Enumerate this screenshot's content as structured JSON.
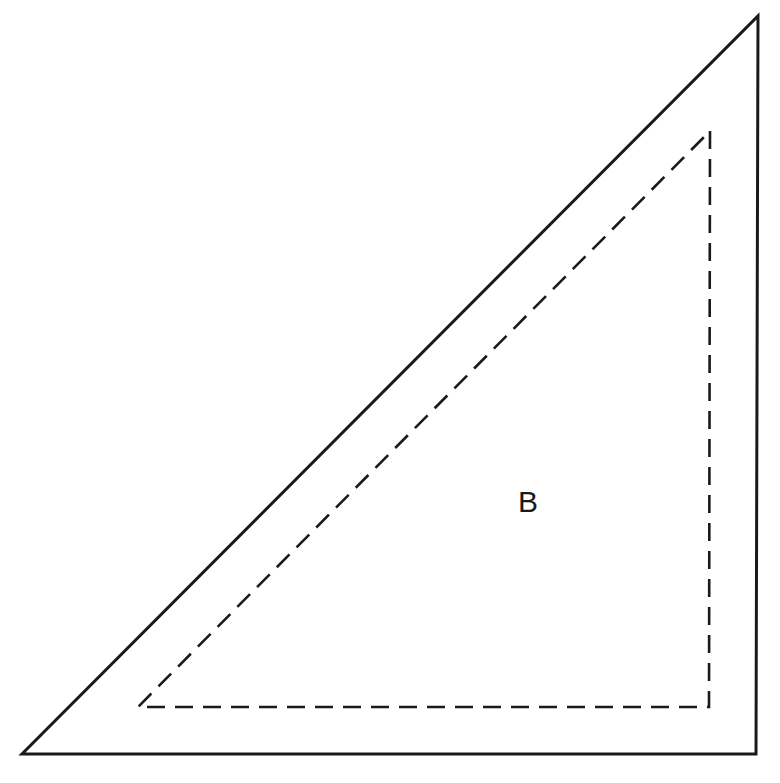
{
  "diagram": {
    "label": "B",
    "outer_triangle": {
      "style": "solid",
      "stroke": "#1a1a1a",
      "points": [
        [
          758,
          16
        ],
        [
          756,
          754
        ],
        [
          22,
          754
        ]
      ]
    },
    "inner_triangle": {
      "style": "dashed",
      "stroke": "#1a1a1a",
      "points": [
        [
          710,
          131
        ],
        [
          709,
          707
        ],
        [
          138,
          707
        ]
      ]
    }
  }
}
